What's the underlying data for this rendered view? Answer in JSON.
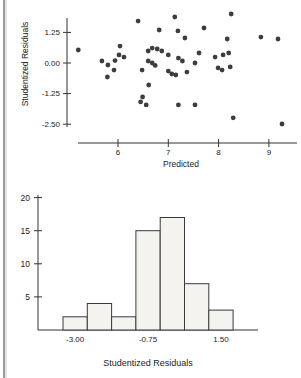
{
  "page": {
    "background": "#ffffff",
    "margin_rule_dark": "#9a9a9a",
    "margin_rule_light": "#e2e2e2"
  },
  "chart_data": [
    {
      "type": "scatter",
      "title": "",
      "xlabel": "Predicted",
      "ylabel": "Studentized Residuals",
      "xlim": [
        5.1,
        9.55
      ],
      "ylim": [
        -2.85,
        2.1
      ],
      "grid": false,
      "dot_color": "#3d3d3d",
      "axis_color": "#333333",
      "x_ticks": [
        {
          "value": 6,
          "label": "6"
        },
        {
          "value": 7,
          "label": "7"
        },
        {
          "value": 8,
          "label": "8"
        },
        {
          "value": 9,
          "label": "9"
        }
      ],
      "y_ticks": [
        {
          "value": 1.25,
          "label": "1.25"
        },
        {
          "value": 0.0,
          "label": "0.00"
        },
        {
          "value": -1.25,
          "label": "-1.25"
        },
        {
          "value": -2.5,
          "label": "-2.50"
        }
      ],
      "points": [
        [
          5.21,
          0.53
        ],
        [
          5.68,
          0.08
        ],
        [
          5.8,
          -0.08
        ],
        [
          5.94,
          0.1
        ],
        [
          6.02,
          0.33
        ],
        [
          5.92,
          -0.29
        ],
        [
          5.79,
          -0.57
        ],
        [
          6.04,
          0.69
        ],
        [
          6.12,
          0.24
        ],
        [
          6.4,
          1.71
        ],
        [
          6.48,
          -0.29
        ],
        [
          6.49,
          -1.39
        ],
        [
          6.45,
          -1.59
        ],
        [
          6.56,
          -1.71
        ],
        [
          6.61,
          -0.9
        ],
        [
          6.6,
          0.49
        ],
        [
          6.68,
          0.61
        ],
        [
          6.78,
          0.57
        ],
        [
          6.87,
          0.49
        ],
        [
          6.6,
          0.08
        ],
        [
          6.68,
          0.0
        ],
        [
          6.82,
          1.35
        ],
        [
          6.74,
          -0.1
        ],
        [
          7.0,
          -0.33
        ],
        [
          7.07,
          -0.45
        ],
        [
          7.13,
          1.88
        ],
        [
          7.2,
          -1.71
        ],
        [
          7.19,
          1.31
        ],
        [
          7.0,
          0.33
        ],
        [
          7.33,
          1.02
        ],
        [
          7.2,
          0.2
        ],
        [
          7.28,
          0.08
        ],
        [
          7.15,
          -0.49
        ],
        [
          7.37,
          -0.37
        ],
        [
          7.53,
          -1.71
        ],
        [
          7.53,
          0.0
        ],
        [
          7.61,
          0.41
        ],
        [
          7.71,
          1.43
        ],
        [
          7.93,
          0.24
        ],
        [
          8.09,
          0.33
        ],
        [
          7.99,
          -0.2
        ],
        [
          8.07,
          -0.29
        ],
        [
          8.25,
          2.0
        ],
        [
          8.17,
          0.98
        ],
        [
          8.2,
          0.41
        ],
        [
          8.23,
          -0.16
        ],
        [
          8.84,
          1.06
        ],
        [
          9.18,
          0.98
        ],
        [
          8.29,
          -2.24
        ],
        [
          9.26,
          -2.49
        ]
      ]
    },
    {
      "type": "bar",
      "title": "",
      "xlabel": "Studentized Residuals",
      "ylabel": "",
      "bin_centers": [
        -3.0,
        -2.25,
        -1.5,
        -0.75,
        0.0,
        0.75,
        1.5
      ],
      "bin_width": 0.75,
      "counts": [
        2,
        4,
        2,
        15,
        17,
        7,
        3
      ],
      "ylim": [
        0,
        21
      ],
      "grid": false,
      "y_ticks": [
        {
          "value": 5,
          "label": "5"
        },
        {
          "value": 10,
          "label": "10"
        },
        {
          "value": 15,
          "label": "15"
        },
        {
          "value": 20,
          "label": "20"
        }
      ],
      "x_tick_labels": [
        {
          "value": -3.0,
          "label": "-3.00"
        },
        {
          "value": -0.75,
          "label": "-0.75"
        },
        {
          "value": 1.5,
          "label": "1.50"
        }
      ],
      "bar_fill": "#f4f3f0",
      "bar_stroke": "#3a3a3a",
      "axis_color": "#333333"
    }
  ]
}
